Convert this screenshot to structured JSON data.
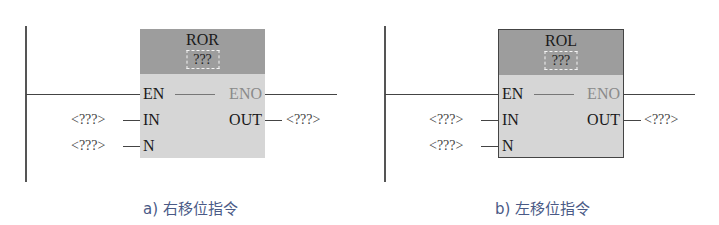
{
  "diagrams": [
    {
      "instruction": "ROR",
      "param": "???",
      "pins": {
        "en": "EN",
        "eno": "ENO",
        "in": "IN",
        "out": "OUT",
        "n": "N"
      },
      "operands": {
        "in": "<???>",
        "n": "<???>",
        "out": "<???>"
      },
      "caption": "a) 右移位指令",
      "bordered": false
    },
    {
      "instruction": "ROL",
      "param": "???",
      "pins": {
        "en": "EN",
        "eno": "ENO",
        "in": "IN",
        "out": "OUT",
        "n": "N"
      },
      "operands": {
        "in": "<???>",
        "n": "<???>",
        "out": "<???>"
      },
      "caption": "b) 左移位指令",
      "bordered": true
    }
  ],
  "colors": {
    "box_header": "#9d9d9d",
    "box_body": "#d6d6d6",
    "eno_text": "#8a8a8a",
    "caption": "#4a5a86",
    "wire": "#444444"
  }
}
